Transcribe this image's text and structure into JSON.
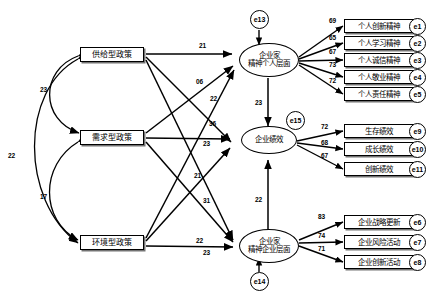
{
  "diagram": {
    "type": "sem-path-diagram"
  },
  "exogenous": [
    {
      "id": "supply",
      "label": "供给型政策"
    },
    {
      "id": "demand",
      "label": "需求型政策"
    },
    {
      "id": "environment",
      "label": "环境型政策"
    }
  ],
  "latent": [
    {
      "id": "ent_individual",
      "line1": "企业家",
      "line2": "精神个人层面"
    },
    {
      "id": "firm_perf",
      "line1": "企业绩效",
      "line2": ""
    },
    {
      "id": "ent_firm",
      "line1": "企业家",
      "line2": "精神企业层面"
    }
  ],
  "disturbances": [
    {
      "id": "e13",
      "label": "e13"
    },
    {
      "id": "e15",
      "label": "e15"
    },
    {
      "id": "e14",
      "label": "e14"
    }
  ],
  "indicators_individual": [
    {
      "label": "个人创新精神",
      "err": "e1",
      "loading": "69"
    },
    {
      "label": "个人学习精神",
      "err": "e2",
      "loading": "65"
    },
    {
      "label": "个人诚信精神",
      "err": "e3",
      "loading": "67"
    },
    {
      "label": "个人敬业精神",
      "err": "e4",
      "loading": "73"
    },
    {
      "label": "个人责任精神",
      "err": "e5",
      "loading": "72"
    }
  ],
  "indicators_performance": [
    {
      "label": "生存绩效",
      "err": "e9",
      "loading": "72"
    },
    {
      "label": "成长绩效",
      "err": "e10",
      "loading": "68"
    },
    {
      "label": "创新绩效",
      "err": "e11",
      "loading": "67"
    }
  ],
  "indicators_firm": [
    {
      "label": "企业战略更新",
      "err": "e6",
      "loading": "83"
    },
    {
      "label": "企业风险活动",
      "err": "e7",
      "loading": "74"
    },
    {
      "label": "企业创新活动",
      "err": "e8",
      "loading": "71"
    }
  ],
  "structural_paths": [
    {
      "id": "supply_to_individual",
      "value": "21"
    },
    {
      "id": "supply_to_perf",
      "value": "06"
    },
    {
      "id": "supply_to_firm",
      "value": "31"
    },
    {
      "id": "demand_to_individual",
      "value": "22"
    },
    {
      "id": "demand_to_perf",
      "value": "23"
    },
    {
      "id": "demand_to_firm",
      "value": "22"
    },
    {
      "id": "environment_to_individual",
      "value": "36"
    },
    {
      "id": "environment_to_perf",
      "value": "21"
    },
    {
      "id": "environment_to_firm",
      "value": "23"
    },
    {
      "id": "individual_to_perf",
      "value": "23"
    },
    {
      "id": "firm_to_perf",
      "value": "22"
    }
  ],
  "correlations": [
    {
      "id": "supply_demand",
      "value": "23"
    },
    {
      "id": "supply_environment",
      "value": "22"
    },
    {
      "id": "demand_environment",
      "value": "17"
    }
  ],
  "colors": {
    "stroke": "#000000",
    "fill": "#ffffff",
    "text": "#000000"
  }
}
